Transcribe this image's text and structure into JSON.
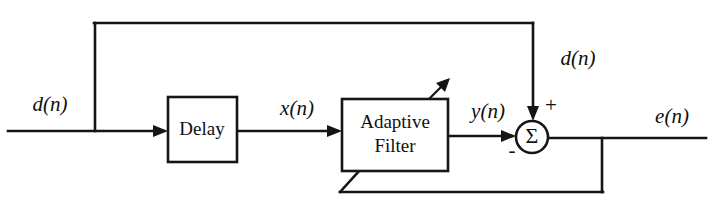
{
  "diagram": {
    "type": "block-diagram",
    "background_color": "#ffffff",
    "line_color": "#151515",
    "blocks": [
      {
        "id": "delay",
        "label": "Delay",
        "x": 168,
        "y": 97,
        "width": 69,
        "height": 65
      },
      {
        "id": "adaptive-filter",
        "label_line1": "Adaptive",
        "label_line2": "Filter",
        "x": 342,
        "y": 99,
        "width": 106,
        "height": 72
      }
    ],
    "summing_junction": {
      "id": "summer",
      "glyph": "Σ",
      "cx": 532,
      "cy": 137,
      "r": 16,
      "plus_sign": "+",
      "minus_sign": "-"
    },
    "signals": [
      {
        "id": "input-dn",
        "label": "d(n)",
        "x": 50,
        "y": 106
      },
      {
        "id": "delayed-xn",
        "label": "x(n)",
        "x": 297,
        "y": 110
      },
      {
        "id": "filter-yn",
        "label": "y(n)",
        "x": 488,
        "y": 113
      },
      {
        "id": "desired-dn",
        "label": "d(n)",
        "x": 578,
        "y": 60
      },
      {
        "id": "error-en",
        "label": "e(n)",
        "x": 672,
        "y": 118
      }
    ]
  }
}
